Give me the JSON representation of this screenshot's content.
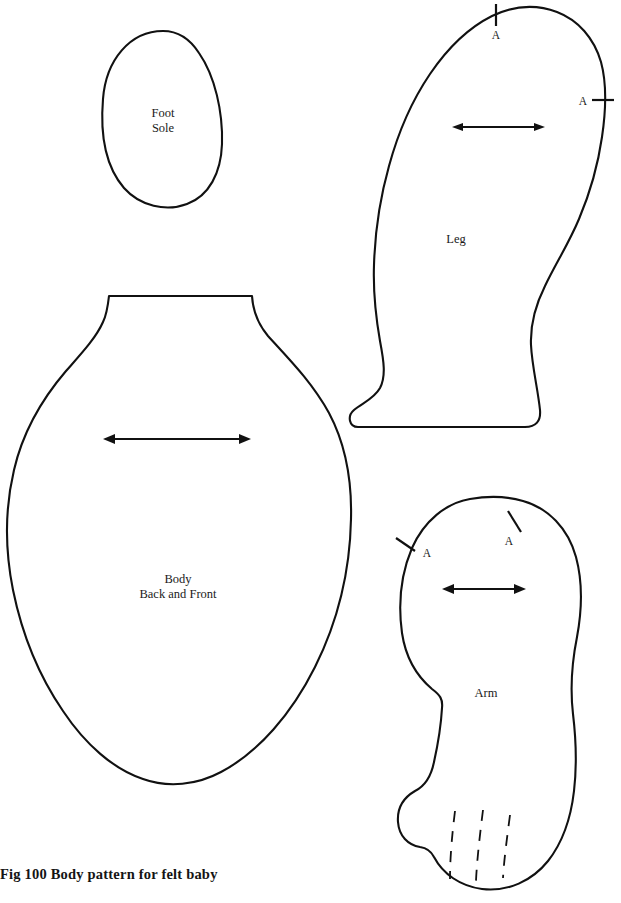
{
  "figure": {
    "caption": "Fig 100 Body pattern for felt baby",
    "page_width": 621,
    "page_height": 903,
    "background_color": "#ffffff",
    "ink_color": "#111111"
  },
  "pieces": [
    {
      "id": "foot-sole",
      "label_lines": [
        "Foot",
        "Sole"
      ],
      "label_line1": "Foot",
      "label_line2": "Sole",
      "notches": [],
      "grain_arrow": false,
      "dashed_lines": 0
    },
    {
      "id": "leg",
      "label_lines": [
        "Leg"
      ],
      "label_line1": "Leg",
      "notches": [
        {
          "label": "A",
          "position": "top"
        },
        {
          "label": "A",
          "position": "right"
        }
      ],
      "grain_arrow": true,
      "dashed_lines": 0
    },
    {
      "id": "body",
      "label_lines": [
        "Body",
        "Back and Front"
      ],
      "label_line1": "Body",
      "label_line2": "Back and Front",
      "notches": [],
      "grain_arrow": true,
      "dashed_lines": 0
    },
    {
      "id": "arm",
      "label_lines": [
        "Arm"
      ],
      "label_line1": "Arm",
      "notches": [
        {
          "label": "A",
          "position": "upper-left"
        },
        {
          "label": "A",
          "position": "upper-right"
        }
      ],
      "grain_arrow": true,
      "dashed_lines": 3
    }
  ],
  "notch_marks": {
    "leg_top": "A",
    "leg_right": "A",
    "arm_left": "A",
    "arm_right": "A"
  }
}
